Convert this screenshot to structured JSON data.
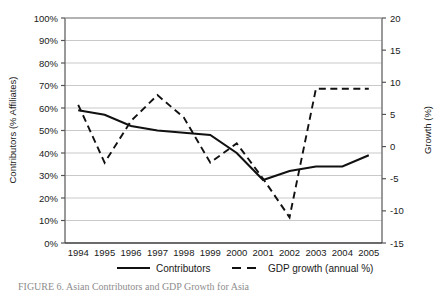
{
  "figure": {
    "caption": "FIGURE 6.   Asian Contributors and GDP Growth for Asia"
  },
  "chart_data": {
    "type": "line",
    "title": "",
    "xlabel": "",
    "categories": [
      "1994",
      "1995",
      "1996",
      "1997",
      "1998",
      "1999",
      "2000",
      "2001",
      "2002",
      "2003",
      "2004",
      "2005"
    ],
    "grid": true,
    "legend_position": "bottom",
    "axes": {
      "left": {
        "label": "Contributors (% Affiliates)",
        "ticks": [
          "0%",
          "10%",
          "20%",
          "30%",
          "40%",
          "50%",
          "60%",
          "70%",
          "80%",
          "90%",
          "100%"
        ],
        "values": [
          0,
          10,
          20,
          30,
          40,
          50,
          60,
          70,
          80,
          90,
          100
        ],
        "lim": [
          0,
          100
        ]
      },
      "right": {
        "label": "Growth (%)",
        "ticks": [
          "-15",
          "-10",
          "-5",
          "0",
          "5",
          "10",
          "15",
          "20"
        ],
        "values": [
          -15,
          -10,
          -5,
          0,
          5,
          10,
          15,
          20
        ],
        "lim": [
          -15,
          20
        ]
      }
    },
    "series": [
      {
        "name": "Contributors",
        "style": "solid",
        "axis": "left",
        "color": "#000000",
        "values": [
          59,
          57,
          52,
          50,
          49,
          48,
          40,
          28,
          32,
          34,
          34,
          39
        ]
      },
      {
        "name": "GDP growth (annual %)",
        "style": "dashed",
        "axis": "right",
        "color": "#000000",
        "values": [
          6.5,
          -2.5,
          4.0,
          8.0,
          4.5,
          -2.5,
          0.5,
          -5.0,
          -11.0,
          9.0,
          9.0,
          9.0
        ]
      }
    ]
  },
  "legend": {
    "items": [
      {
        "label": "Contributors",
        "style": "solid"
      },
      {
        "label": "GDP growth (annual %)",
        "style": "dashed"
      }
    ]
  }
}
